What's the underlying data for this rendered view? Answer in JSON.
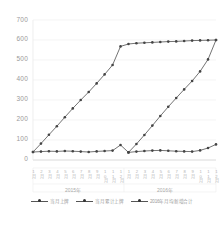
{
  "chart_data": {
    "type": "line",
    "title": "",
    "xlabel": "",
    "ylabel": "",
    "ylim": [
      0,
      700
    ],
    "yticks": [
      0,
      100,
      200,
      300,
      400,
      500,
      600,
      700
    ],
    "grid": true,
    "legend_position": "bottom",
    "group_labels": [
      "2015年",
      "2016年"
    ],
    "categories": [
      "1月",
      "2月",
      "3月",
      "4月",
      "5月",
      "6月",
      "7月",
      "8月",
      "9月",
      "10月",
      "11月",
      "12月",
      "1月",
      "2月",
      "3月",
      "4月",
      "5月",
      "6月",
      "7月",
      "8月",
      "9月",
      "10月",
      "11月",
      "12月"
    ],
    "series": [
      {
        "name": "当月上牌",
        "values": [
          40,
          42,
          44,
          43,
          45,
          44,
          42,
          40,
          43,
          45,
          47,
          75,
          38,
          42,
          45,
          47,
          48,
          46,
          44,
          43,
          42,
          48,
          60,
          78
        ],
        "marker": "circle",
        "color": "#444444"
      },
      {
        "name": "当月累计上牌",
        "values": [
          40,
          82,
          126,
          169,
          214,
          258,
          300,
          340,
          383,
          428,
          475,
          568,
          580,
          584,
          586,
          588,
          590,
          592,
          593,
          595,
          597,
          598,
          599,
          600
        ],
        "marker": "circle",
        "color": "#444444"
      },
      {
        "name": "2016年月均新增合计",
        "values": [
          null,
          null,
          null,
          null,
          null,
          null,
          null,
          null,
          null,
          null,
          null,
          null,
          38,
          80,
          125,
          172,
          220,
          266,
          310,
          353,
          395,
          443,
          503,
          600
        ],
        "marker": "circle",
        "color": "#444444"
      }
    ]
  },
  "axis": {
    "y_labels": [
      "700",
      "600",
      "500",
      "400",
      "300",
      "200",
      "100",
      "0"
    ],
    "x_labels": [
      "1月",
      "2月",
      "3月",
      "4月",
      "5月",
      "6月",
      "7月",
      "8月",
      "9月",
      "10月",
      "11月",
      "12月",
      "1月",
      "2月",
      "3月",
      "4月",
      "5月",
      "6月",
      "7月",
      "8月",
      "9月",
      "10月",
      "11月",
      "12月"
    ]
  },
  "groups": [
    {
      "label": "2015年"
    },
    {
      "label": "2016年"
    }
  ],
  "legend": {
    "items": [
      {
        "label": "当月上牌"
      },
      {
        "label": "当月累计上牌"
      },
      {
        "label": "2016年月均新增合计"
      }
    ]
  },
  "footer": {
    "mark": ""
  }
}
